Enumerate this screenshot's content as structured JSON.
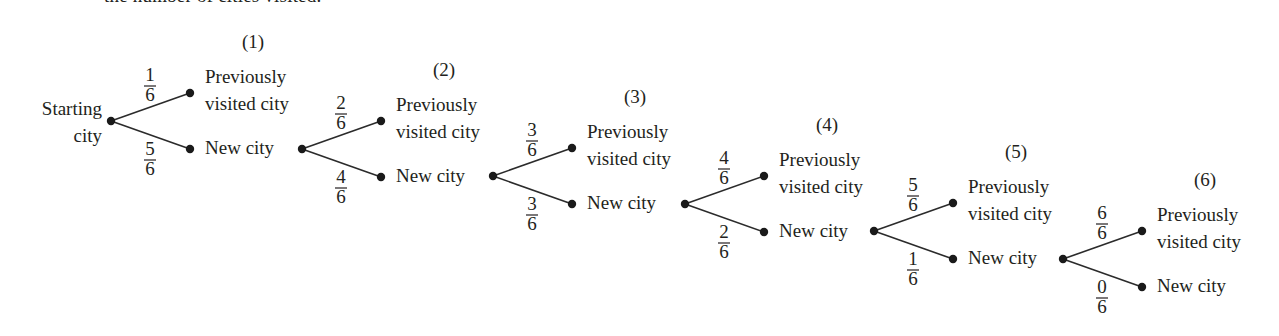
{
  "caption": {
    "text": "the number of cities visited."
  },
  "diagram": {
    "root_label": [
      "Starting",
      "city"
    ],
    "branch_labels": {
      "upper": [
        "Previously",
        "visited city"
      ],
      "lower": "New city"
    },
    "stages": [
      {
        "step": "(1)",
        "upper_prob": {
          "num": "1",
          "den": "6"
        },
        "lower_prob": {
          "num": "5",
          "den": "6"
        }
      },
      {
        "step": "(2)",
        "upper_prob": {
          "num": "2",
          "den": "6"
        },
        "lower_prob": {
          "num": "4",
          "den": "6"
        }
      },
      {
        "step": "(3)",
        "upper_prob": {
          "num": "3",
          "den": "6"
        },
        "lower_prob": {
          "num": "3",
          "den": "6"
        }
      },
      {
        "step": "(4)",
        "upper_prob": {
          "num": "4",
          "den": "6"
        },
        "lower_prob": {
          "num": "2",
          "den": "6"
        }
      },
      {
        "step": "(5)",
        "upper_prob": {
          "num": "5",
          "den": "6"
        },
        "lower_prob": {
          "num": "1",
          "den": "6"
        }
      },
      {
        "step": "(6)",
        "upper_prob": {
          "num": "6",
          "den": "6"
        },
        "lower_prob": {
          "num": "0",
          "den": "6"
        }
      }
    ]
  },
  "layout": {
    "roots": [
      [
        111,
        121
      ],
      [
        302,
        149
      ],
      [
        493,
        176
      ],
      [
        685,
        204
      ],
      [
        874,
        231
      ],
      [
        1063,
        259
      ]
    ],
    "leaf_dx": 79,
    "leaf_dy_up": -28,
    "leaf_dy_down": 28,
    "node_radius": 4.2,
    "colors": {
      "ink": "#231f20",
      "line": "#2b2b2b"
    }
  }
}
